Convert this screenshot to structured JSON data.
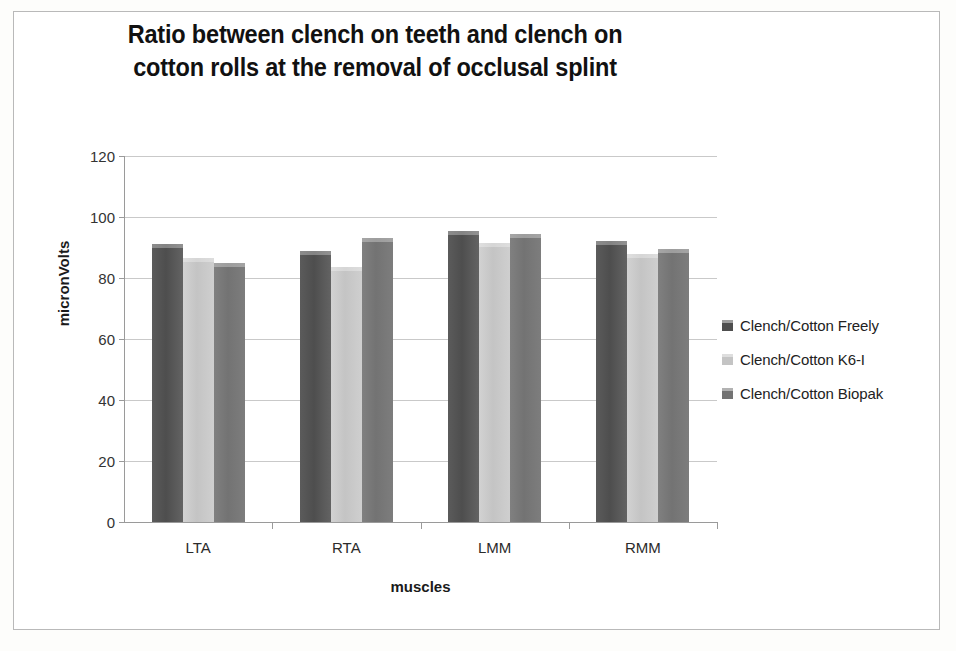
{
  "chart_data": {
    "type": "bar",
    "title": "Ratio between clench on teeth and clench on cotton rolls at the removal of occlusal splint",
    "title_line1": "Ratio between clench on teeth and clench on",
    "title_line2": "cotton rolls at the removal of occlusal splint",
    "xlabel": "muscles",
    "ylabel": "micronVolts",
    "categories": [
      "LTA",
      "RTA",
      "LMM",
      "RMM"
    ],
    "ylim": [
      0,
      120
    ],
    "yticks": [
      0,
      20,
      40,
      60,
      80,
      100,
      120
    ],
    "ytick_labels": [
      "0",
      "20",
      "40",
      "60",
      "80",
      "100",
      "120"
    ],
    "grid": true,
    "legend_position": "right",
    "series": [
      {
        "name": "Clench/Cotton Freely",
        "color": "#4e4e4e",
        "values": [
          91,
          89,
          95.5,
          92
        ]
      },
      {
        "name": "Clench/Cotton K6-I",
        "color": "#c4c4c4",
        "values": [
          86.5,
          83.5,
          91.5,
          88
        ]
      },
      {
        "name": "Clench/Cotton Biopak",
        "color": "#737373",
        "values": [
          85,
          93,
          94.5,
          89.5
        ]
      }
    ]
  }
}
